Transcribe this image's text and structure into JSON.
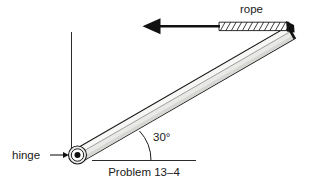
{
  "figure": {
    "caption": "Problem 13–4",
    "background_color": "#ffffff",
    "labels": {
      "rope": "rope",
      "hinge": "hinge",
      "angle": "30°"
    },
    "angle_value": 30,
    "angle_unit": "degrees",
    "colors": {
      "ink": "#1a1a1a",
      "beam_fill": "#e9e9e7",
      "beam_highlight": "#f7f7f6",
      "beam_shadow": "#d6d6d3",
      "outline": "#1c1c1c",
      "arrow": "#111111"
    },
    "elements": {
      "beam": "inclined-cylindrical-beam",
      "hinge": "pivot-circle-with-center-dot",
      "rope": "braided-rope-horizontal",
      "tension_arrow": "left-pointing-arrow",
      "vertical_reference": "vertical-dashed-reference-line",
      "ground_reference": "horizontal-baseline",
      "angle_arc": "angle-arc-between-beam-and-horizontal"
    }
  }
}
